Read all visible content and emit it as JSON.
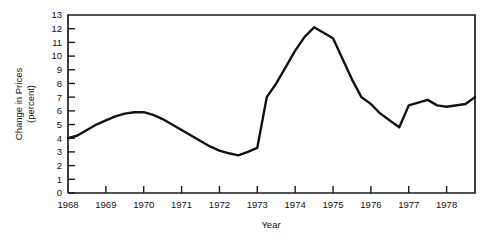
{
  "chart_data": {
    "type": "line",
    "title": "",
    "xlabel": "Year",
    "ylabel": "Change in Prices (percent)",
    "ylabel_line1": "Change in Prices",
    "ylabel_line2": "(percent)",
    "xlim": [
      1968,
      1978.75
    ],
    "ylim": [
      0,
      13
    ],
    "grid": false,
    "legend": false,
    "yticks": [
      0,
      1,
      2,
      3,
      4,
      5,
      6,
      7,
      8,
      9,
      10,
      11,
      12,
      13
    ],
    "ytick_labels": [
      "0",
      "1",
      "2",
      "3",
      "4",
      "5",
      "6",
      "7",
      "8",
      "9",
      "10",
      "11",
      "12",
      "13"
    ],
    "xticks": [
      1968,
      1969,
      1970,
      1971,
      1972,
      1973,
      1974,
      1975,
      1976,
      1977,
      1978
    ],
    "xtick_labels": [
      "1968",
      "1969",
      "1970",
      "1971",
      "1972",
      "1973",
      "1974",
      "1975",
      "1976",
      "1977",
      "1978"
    ],
    "series": [
      {
        "name": "Change in Prices",
        "x": [
          1968.0,
          1968.25,
          1968.5,
          1968.75,
          1969.0,
          1969.25,
          1969.5,
          1969.75,
          1970.0,
          1970.25,
          1970.5,
          1970.75,
          1971.0,
          1971.25,
          1971.5,
          1971.75,
          1972.0,
          1972.25,
          1972.5,
          1972.75,
          1973.0,
          1973.25,
          1973.5,
          1973.75,
          1974.0,
          1974.25,
          1974.5,
          1974.75,
          1975.0,
          1975.25,
          1975.5,
          1975.75,
          1976.0,
          1976.25,
          1976.5,
          1976.75,
          1977.0,
          1977.25,
          1977.5,
          1977.75,
          1978.0,
          1978.5,
          1978.75
        ],
        "values": [
          4.0,
          4.2,
          4.6,
          5.0,
          5.3,
          5.6,
          5.8,
          5.9,
          5.9,
          5.7,
          5.4,
          5.0,
          4.6,
          4.2,
          3.8,
          3.4,
          3.1,
          2.9,
          2.75,
          3.0,
          3.3,
          7.0,
          8.0,
          9.2,
          10.4,
          11.4,
          12.1,
          11.7,
          11.3,
          9.8,
          8.3,
          7.0,
          6.5,
          5.8,
          5.3,
          4.8,
          6.4,
          6.6,
          6.8,
          6.4,
          6.3,
          6.5,
          7.0
        ]
      }
    ]
  },
  "axes": {
    "x_axis_title": "Year",
    "y_axis_title_line1": "Change in Prices",
    "y_axis_title_line2": "(percent)"
  },
  "colors": {
    "line": "#121212",
    "axis": "#1a1a1a",
    "text": "#111111",
    "background": "#ffffff"
  }
}
